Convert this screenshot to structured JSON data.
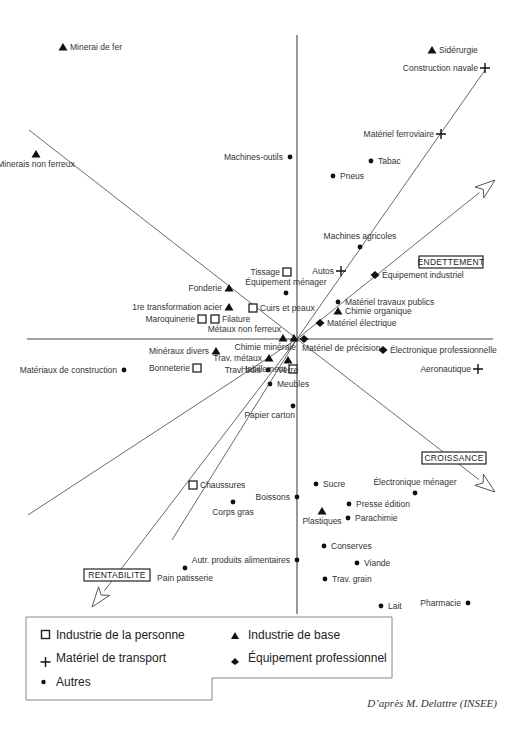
{
  "chart_data": {
    "type": "scatter",
    "title": "",
    "subtitle": "",
    "xlabel": "",
    "ylabel": "",
    "grid": false,
    "legend_position": "bottom-left",
    "axes": {
      "vertical": {
        "x": 297,
        "y1": 35,
        "y2": 614
      },
      "horizontal": {
        "y": 339,
        "x1": 27,
        "x2": 493
      }
    },
    "directional_axes": [
      {
        "name": "ENDETTEMENT",
        "from": [
          297,
          339
        ],
        "to": [
          495,
          180
        ],
        "arrow": true,
        "label_pos": [
          451,
          262
        ]
      },
      {
        "name": "CROISSANCE",
        "from": [
          297,
          339
        ],
        "to": [
          495,
          492
        ],
        "arrow": true,
        "label_pos": [
          455,
          458
        ]
      },
      {
        "name": "RENTABILITE",
        "from": [
          297,
          339
        ],
        "to": [
          92,
          607
        ],
        "arrow": true,
        "label_pos": [
          120,
          575
        ]
      }
    ],
    "reference_lines": [
      {
        "from": [
          29,
          130
        ],
        "to": [
          297,
          339
        ]
      },
      {
        "from": [
          297,
          339
        ],
        "to": [
          485,
          70
        ]
      },
      {
        "from": [
          297,
          339
        ],
        "to": [
          28,
          515
        ]
      },
      {
        "from": [
          297,
          339
        ],
        "to": [
          172,
          540
        ]
      }
    ],
    "series": [
      {
        "name": "Industrie de la personne",
        "marker": "square",
        "points": [
          {
            "label": "Tissage",
            "x": 287,
            "y": 272,
            "label_side": "left"
          },
          {
            "label": "Cuirs et peaux",
            "x": 253,
            "y": 308,
            "label_side": "right"
          },
          {
            "label": "Maroquinerie",
            "x": 202,
            "y": 319,
            "label_side": "left"
          },
          {
            "label": "Filature",
            "x": 215,
            "y": 319,
            "label_side": "right"
          },
          {
            "label": "Bonneterie",
            "x": 197,
            "y": 368,
            "label_side": "left"
          },
          {
            "label": "Habillement",
            "x": 293,
            "y": 369,
            "label_side": "left"
          },
          {
            "label": "Chaussures",
            "x": 193,
            "y": 485,
            "label_side": "right"
          }
        ]
      },
      {
        "name": "Industrie de base",
        "marker": "triangle",
        "points": [
          {
            "label": "Minerai de fer",
            "x": 63,
            "y": 47,
            "label_side": "right"
          },
          {
            "label": "Sidérurgie",
            "x": 432,
            "y": 50,
            "label_side": "right"
          },
          {
            "label": "Minerais non ferreux",
            "x": 36,
            "y": 154,
            "label_side": "below"
          },
          {
            "label": "Fonderie",
            "x": 229,
            "y": 288,
            "label_side": "left"
          },
          {
            "label": "1re transformation acier",
            "x": 229,
            "y": 307,
            "label_side": "left"
          },
          {
            "label": "Métaux non ferreux",
            "x": 283,
            "y": 338,
            "label_side": "above-left"
          },
          {
            "label": "Chimie minérale",
            "x": 294,
            "y": 338,
            "label_side": "below-left"
          },
          {
            "label": "Minéraux divers",
            "x": 216,
            "y": 351,
            "label_side": "left"
          },
          {
            "label": "Trav. métaux",
            "x": 269,
            "y": 358,
            "label_side": "left"
          },
          {
            "label": "Verre",
            "x": 288,
            "y": 360,
            "label_side": "below"
          },
          {
            "label": "Chimie organique",
            "x": 338,
            "y": 311,
            "label_side": "right"
          },
          {
            "label": "Plastiques",
            "x": 322,
            "y": 511,
            "label_side": "below"
          }
        ]
      },
      {
        "name": "Matériel de transport",
        "marker": "plus",
        "points": [
          {
            "label": "Construction navale",
            "x": 485,
            "y": 68,
            "label_side": "left"
          },
          {
            "label": "Matériel ferroviaire",
            "x": 441,
            "y": 134,
            "label_side": "left"
          },
          {
            "label": "Autos",
            "x": 341,
            "y": 271,
            "label_side": "left"
          },
          {
            "label": "Aeronautique",
            "x": 478,
            "y": 369,
            "label_side": "left"
          }
        ]
      },
      {
        "name": "Équipement professionnel",
        "marker": "diamond",
        "points": [
          {
            "label": "Équipement industriel",
            "x": 375,
            "y": 275,
            "label_side": "right"
          },
          {
            "label": "Matériel électrique",
            "x": 320,
            "y": 323,
            "label_side": "right"
          },
          {
            "label": "Matériel de précision",
            "x": 304,
            "y": 339,
            "label_side": "below-right"
          },
          {
            "label": "Électronique professionnelle",
            "x": 383,
            "y": 350,
            "label_side": "right"
          }
        ]
      },
      {
        "name": "Autres",
        "marker": "circle",
        "points": [
          {
            "label": "Machines-outils",
            "x": 290,
            "y": 157,
            "label_side": "left"
          },
          {
            "label": "Tabac",
            "x": 371,
            "y": 161,
            "label_side": "right"
          },
          {
            "label": "Pneus",
            "x": 333,
            "y": 176,
            "label_side": "right"
          },
          {
            "label": "Machines agricoles",
            "x": 360,
            "y": 247,
            "label_side": "above"
          },
          {
            "label": "Équipement ménager",
            "x": 286,
            "y": 293,
            "label_side": "above"
          },
          {
            "label": "Matériel travaux publics",
            "x": 338,
            "y": 302,
            "label_side": "right"
          },
          {
            "label": "Trav. bois",
            "x": 268,
            "y": 370,
            "label_side": "left"
          },
          {
            "label": "Meubles",
            "x": 270,
            "y": 384,
            "label_side": "right"
          },
          {
            "label": "Papier carton",
            "x": 293,
            "y": 406,
            "label_side": "below-left"
          },
          {
            "label": "Matériaux de construction",
            "x": 124,
            "y": 370,
            "label_side": "left"
          },
          {
            "label": "Sucre",
            "x": 316,
            "y": 484,
            "label_side": "right"
          },
          {
            "label": "Électronique ménager",
            "x": 415,
            "y": 493,
            "label_side": "above"
          },
          {
            "label": "Boissons",
            "x": 297,
            "y": 497,
            "label_side": "left"
          },
          {
            "label": "Corps gras",
            "x": 233,
            "y": 502,
            "label_side": "below"
          },
          {
            "label": "Presse édition",
            "x": 349,
            "y": 504,
            "label_side": "right"
          },
          {
            "label": "Parachimie",
            "x": 348,
            "y": 518,
            "label_side": "right"
          },
          {
            "label": "Conserves",
            "x": 324,
            "y": 546,
            "label_side": "right"
          },
          {
            "label": "Autr. produits alimentaires",
            "x": 297,
            "y": 560,
            "label_side": "left"
          },
          {
            "label": "Pain patisserie",
            "x": 185,
            "y": 568,
            "label_side": "below"
          },
          {
            "label": "Viande",
            "x": 357,
            "y": 563,
            "label_side": "right"
          },
          {
            "label": "Trav. grain",
            "x": 325,
            "y": 579,
            "label_side": "right"
          },
          {
            "label": "Lait",
            "x": 381,
            "y": 606,
            "label_side": "right"
          },
          {
            "label": "Pharmacie",
            "x": 468,
            "y": 603,
            "label_side": "left"
          }
        ]
      }
    ]
  },
  "legend": {
    "items": [
      {
        "marker": "square",
        "label": "Industrie de la personne"
      },
      {
        "marker": "triangle",
        "label": "Industrie de base"
      },
      {
        "marker": "plus",
        "label": "Matériel de transport"
      },
      {
        "marker": "diamond",
        "label": "Équipement professionnel"
      },
      {
        "marker": "circle",
        "label": "Autres"
      }
    ]
  },
  "axis_labels": {
    "endettement": "ENDETTEMENT",
    "croissance": "CROISSANCE",
    "rentabilite": "RENTABILITE"
  },
  "credit": "D’après M. Delattre (INSEE)"
}
